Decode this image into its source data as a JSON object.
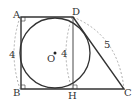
{
  "diagram": {
    "type": "geometry",
    "points": {
      "A": {
        "label": "A"
      },
      "B": {
        "label": "B"
      },
      "C": {
        "label": "C"
      },
      "D": {
        "label": "D"
      },
      "H": {
        "label": "H"
      },
      "O": {
        "label": "O"
      }
    },
    "measurements": {
      "AB": "4",
      "DH": "4",
      "DC": "5"
    },
    "right_angles": [
      "A",
      "B",
      "H"
    ],
    "colors": {
      "stroke": "#333333",
      "dashed": "#999999",
      "background": "#ffffff"
    }
  }
}
